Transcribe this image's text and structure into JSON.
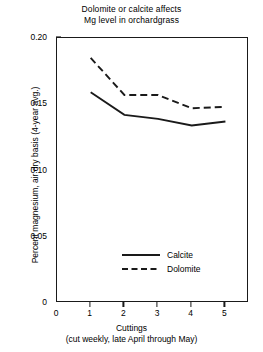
{
  "chart_data": {
    "type": "line",
    "title": "Dolomite or calcite affects Mg level in orchardgrass",
    "title_line1": "Dolomite or calcite affects",
    "title_line2": "Mg level in orchardgrass",
    "xlabel": "Cuttings",
    "xlabel_sub": "(cut weekly, late April through May)",
    "ylabel": "Percent magnesium, air dry basis (4-year avg.)",
    "x": [
      1,
      2,
      3,
      4,
      5
    ],
    "categories": [
      "1",
      "2",
      "3",
      "4",
      "5"
    ],
    "xticklabels": [
      "0",
      "1",
      "2",
      "3",
      "4",
      "5"
    ],
    "xtickvalues": [
      0,
      1,
      2,
      3,
      4,
      5
    ],
    "yticklabels": [
      "0",
      "0.05",
      "0.10",
      "0.15",
      "0.20"
    ],
    "ytickvalues": [
      0,
      0.05,
      0.1,
      0.15,
      0.2
    ],
    "xlim": [
      0,
      5.7
    ],
    "ylim": [
      0,
      0.2
    ],
    "grid": false,
    "legend_position": "lower center inside",
    "series": [
      {
        "name": "Calcite",
        "style": "solid",
        "color": "#1a1a1a",
        "values": [
          0.159,
          0.142,
          0.139,
          0.134,
          0.137
        ]
      },
      {
        "name": "Dolomite",
        "style": "dashed",
        "color": "#1a1a1a",
        "values": [
          0.185,
          0.157,
          0.157,
          0.147,
          0.148
        ]
      }
    ]
  },
  "legend": {
    "items": [
      {
        "label": "Calcite",
        "style": "solid"
      },
      {
        "label": "Dolomite",
        "style": "dashed"
      }
    ]
  }
}
